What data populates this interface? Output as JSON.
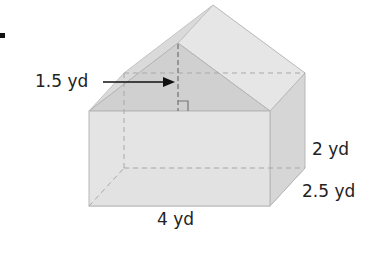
{
  "figure": {
    "type": "composite solid: rectangular prism with triangular prism roof",
    "colors": {
      "face_light": "#e4e4e4",
      "face_mid": "#d9d9d9",
      "face_dark": "#cfcfcf",
      "roof_front": "#d2d2d2",
      "roof_slope": "#e8e8e8",
      "edge": "#b8b8b8",
      "dashed": "#999999",
      "label": "#222222"
    }
  },
  "labels": {
    "roof_height": "1.5 yd",
    "box_height": "2 yd",
    "box_depth": "2.5 yd",
    "box_length": "4 yd"
  }
}
